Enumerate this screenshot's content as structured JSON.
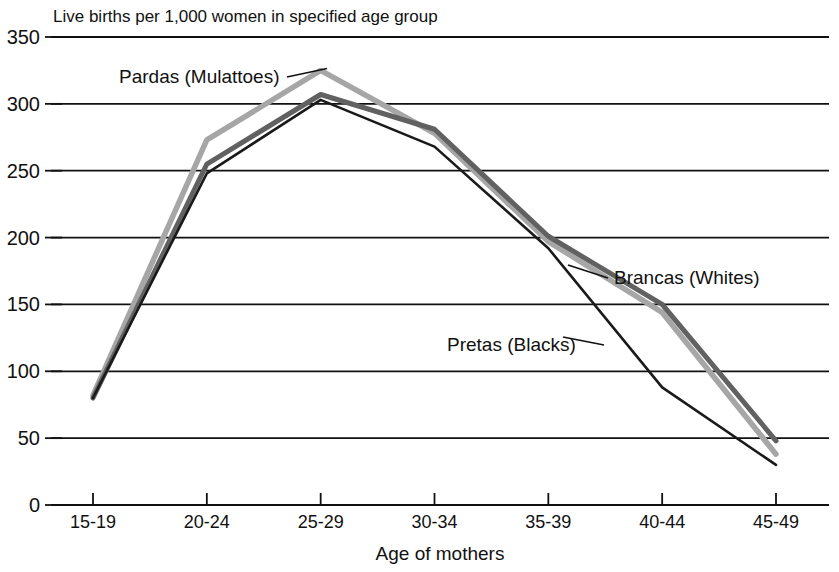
{
  "chart_data": {
    "type": "line",
    "title": "Live births per 1,000 women in specified age group",
    "xlabel": "Age of mothers",
    "ylabel": "",
    "categories": [
      "15-19",
      "20-24",
      "25-29",
      "30-34",
      "35-39",
      "40-44",
      "45-49"
    ],
    "ylim": [
      0,
      350
    ],
    "yticks": [
      "0",
      "50",
      "100",
      "150",
      "200",
      "250",
      "300",
      "350"
    ],
    "ytick_values": [
      0,
      50,
      100,
      150,
      200,
      250,
      300,
      350
    ],
    "grid": "horizontal",
    "legend": "inline-annotations",
    "series": [
      {
        "name": "Pardas (Mulattoes)",
        "color": "#a6a6a6",
        "values": [
          82,
          273,
          325,
          278,
          197,
          144,
          38
        ]
      },
      {
        "name": "Brancas (Whites)",
        "color": "#616161",
        "values": [
          80,
          255,
          307,
          281,
          201,
          150,
          48
        ]
      },
      {
        "name": "Pretas (Blacks)",
        "color": "#1a1a1a",
        "values": [
          80,
          248,
          303,
          268,
          192,
          88,
          30
        ]
      }
    ],
    "annotations": [
      {
        "text": "Pardas (Mulattoes)",
        "series": "Pardas (Mulattoes)",
        "anchor": "25-29"
      },
      {
        "text": "Brancas (Whites)",
        "series": "Brancas (Whites)",
        "anchor": "40-44"
      },
      {
        "text": "Pretas (Blacks)",
        "series": "Pretas (Blacks)",
        "anchor": "35-39"
      }
    ]
  },
  "axis": {
    "zero_label": "0"
  }
}
